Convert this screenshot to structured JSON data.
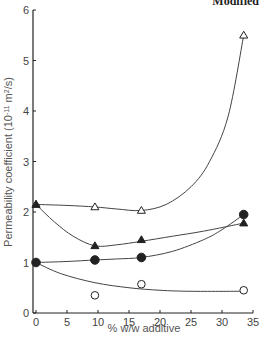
{
  "header_fragment": "Modified",
  "chart_data": {
    "type": "scatter",
    "title": "",
    "xlabel": "% w/w additive",
    "ylabel": "Permeability coefficient (10",
    "ylabel_sup": "-11",
    "ylabel_unit": " m",
    "ylabel_unit_sup": "2",
    "ylabel_tail": "/s)",
    "xlim": [
      0,
      35
    ],
    "ylim": [
      0,
      6
    ],
    "x_ticks": [
      0,
      5,
      10,
      15,
      20,
      25,
      30,
      35
    ],
    "y_ticks": [
      0,
      1,
      2,
      3,
      4,
      5,
      6
    ],
    "grid": false,
    "legend": "none",
    "series": [
      {
        "name": "open-triangle",
        "marker": "triangle-open",
        "x": [
          0,
          9.5,
          17,
          33.5
        ],
        "y": [
          2.15,
          2.1,
          2.03,
          5.5
        ],
        "curve": [
          [
            0,
            2.15
          ],
          [
            5,
            2.13
          ],
          [
            9.5,
            2.1
          ],
          [
            13,
            2.06
          ],
          [
            17,
            2.03
          ],
          [
            21,
            2.15
          ],
          [
            25,
            2.5
          ],
          [
            28,
            3.0
          ],
          [
            31,
            3.9
          ],
          [
            33.5,
            5.5
          ]
        ]
      },
      {
        "name": "filled-triangle",
        "marker": "triangle-filled",
        "x": [
          0,
          9.5,
          17,
          33.5
        ],
        "y": [
          2.15,
          1.33,
          1.45,
          1.78
        ],
        "curve": [
          [
            0,
            2.15
          ],
          [
            3,
            1.8
          ],
          [
            6,
            1.52
          ],
          [
            9.5,
            1.33
          ],
          [
            13,
            1.35
          ],
          [
            17,
            1.42
          ],
          [
            22,
            1.52
          ],
          [
            27,
            1.62
          ],
          [
            33.5,
            1.78
          ]
        ]
      },
      {
        "name": "filled-circle",
        "marker": "circle-filled",
        "x": [
          0,
          9.5,
          17,
          33.5
        ],
        "y": [
          1.0,
          1.05,
          1.1,
          1.95
        ],
        "curve": [
          [
            0,
            1.0
          ],
          [
            5,
            1.02
          ],
          [
            9.5,
            1.05
          ],
          [
            13,
            1.07
          ],
          [
            17,
            1.1
          ],
          [
            22,
            1.22
          ],
          [
            27,
            1.45
          ],
          [
            30,
            1.65
          ],
          [
            33.5,
            1.95
          ]
        ]
      },
      {
        "name": "open-circle",
        "marker": "circle-open",
        "x": [
          9.5,
          17,
          33.5
        ],
        "y": [
          0.35,
          0.57,
          0.45
        ],
        "curve": [
          [
            0,
            1.0
          ],
          [
            4,
            0.78
          ],
          [
            9.5,
            0.6
          ],
          [
            15,
            0.5
          ],
          [
            20,
            0.45
          ],
          [
            25,
            0.43
          ],
          [
            33.5,
            0.43
          ]
        ]
      }
    ]
  }
}
